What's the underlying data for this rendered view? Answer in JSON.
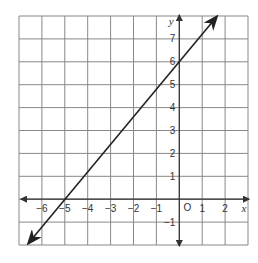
{
  "chart_data": {
    "type": "line",
    "title": "",
    "xlabel": "x",
    "ylabel": "y",
    "origin_label": "O",
    "xlim": [
      -7,
      3
    ],
    "ylim": [
      -2,
      8
    ],
    "grid": true,
    "x_ticks": [
      "-6",
      "-5",
      "-4",
      "-3",
      "-2",
      "-1",
      "1",
      "2"
    ],
    "y_ticks": [
      "7",
      "6",
      "5",
      "4",
      "3",
      "2",
      "1",
      "-1"
    ],
    "series": [
      {
        "name": "line",
        "equation": "y = 1.2x + 6",
        "x": [
          -5,
          0
        ],
        "y": [
          0,
          6
        ],
        "arrows_both_ends": true
      }
    ],
    "colors": {
      "grid": "#888888",
      "axis": "#333333",
      "line": "#222222"
    }
  }
}
